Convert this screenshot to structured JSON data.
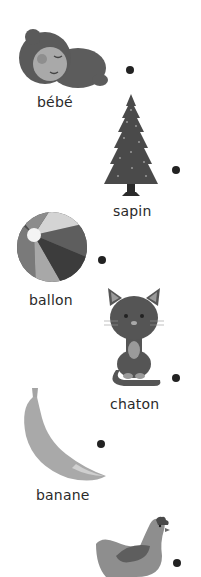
{
  "worksheet": {
    "items": [
      {
        "word": "bébé",
        "picture": "baby-icon"
      },
      {
        "word": "sapin",
        "picture": "fir-tree-icon"
      },
      {
        "word": "ballon",
        "picture": "beach-ball-icon"
      },
      {
        "word": "chaton",
        "picture": "kitten-icon"
      },
      {
        "word": "banane",
        "picture": "banana-icon"
      },
      {
        "word": "poule",
        "picture": "hen-icon"
      }
    ]
  },
  "colors": {
    "dot": "#222222",
    "text": "#2a2a2a"
  }
}
